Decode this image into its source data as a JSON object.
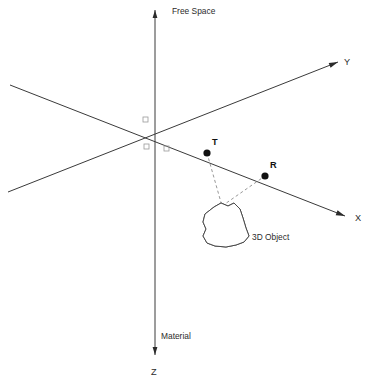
{
  "figure": {
    "type": "diagram",
    "subtype": "3d-coordinate-scattering-geometry",
    "background_color": "#ffffff",
    "width": 368,
    "height": 381
  },
  "regions": {
    "free_space_label": "Free Space",
    "material_label": "Material"
  },
  "axes": [
    {
      "id": "y-axis",
      "label": "Y",
      "label_pos": {
        "x": 344,
        "y": 63
      },
      "from": {
        "x": 8,
        "y": 192
      },
      "to": {
        "x": 338,
        "y": 62
      },
      "arrow": "end",
      "color": "#3a3a3a"
    },
    {
      "id": "z-axis",
      "label": "Z",
      "label_pos": {
        "x": 151,
        "y": 373
      },
      "from": {
        "x": 155,
        "y": 355
      },
      "to": {
        "x": 155,
        "y": 10
      },
      "arrow": "both",
      "color": "#3a3a3a"
    },
    {
      "id": "x-axis",
      "label": "X",
      "label_pos": {
        "x": 355,
        "y": 219
      },
      "from": {
        "x": 10,
        "y": 85
      },
      "to": {
        "x": 345,
        "y": 216
      },
      "arrow": "end",
      "color": "#3a3a3a"
    }
  ],
  "origin": {
    "x": 155,
    "y": 127
  },
  "angle_markers": [
    {
      "id": "marker-upper-left",
      "x": 143,
      "y": 117
    },
    {
      "id": "marker-lower-left",
      "x": 144,
      "y": 144
    },
    {
      "id": "marker-lower-right",
      "x": 164,
      "y": 146
    }
  ],
  "nodes": [
    {
      "id": "transmitter",
      "label": "T",
      "x": 207,
      "y": 153,
      "label_pos": {
        "x": 212,
        "y": 143
      },
      "dot_radius": 3.6,
      "color": "#111111"
    },
    {
      "id": "receiver",
      "label": "R",
      "x": 265,
      "y": 176,
      "label_pos": {
        "x": 270,
        "y": 166
      },
      "dot_radius": 3.6,
      "color": "#111111"
    }
  ],
  "rays": [
    {
      "id": "incident-ray",
      "from": "transmitter",
      "to": "scatter-point",
      "style": "dashed",
      "color": "#8c8c8c"
    },
    {
      "id": "scattered-ray",
      "from": "scatter-point",
      "to": "receiver",
      "style": "dashed",
      "color": "#8c8c8c"
    }
  ],
  "scatter_point": {
    "x": 222,
    "y": 206
  },
  "object": {
    "id": "3d-object",
    "label": "3D Object",
    "label_pos": {
      "x": 252,
      "y": 238
    },
    "fill": "#ffffff",
    "outline": "#4a4a4a",
    "hatch_color": "#6e6e6e",
    "hatch_angle_deg": 45,
    "outline_path": "M 214 207 L 221 203 L 228 206 L 234 203 L 240 209 L 243 218 L 246 228 L 249 236 L 244 242 L 236 245 L 226 247 L 215 246 L 207 243 L 203 236 L 206 229 L 203 222 L 205 214 Z",
    "shade_path": "M 205 214 L 203 222 L 206 229 L 203 236 L 207 243 L 215 246 L 219 244 L 212 239 L 210 230 L 211 221 L 213 212 Z"
  }
}
